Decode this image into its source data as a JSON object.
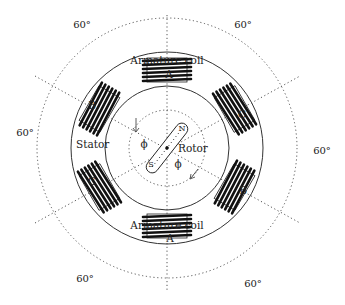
{
  "diagram": {
    "type": "three-phase generator schematic",
    "labels": {
      "armature_top": "Armature coil",
      "armature_bottom": "Armature coil",
      "stator": "Stator",
      "rotor": "Rotor",
      "phi_left": "ϕ",
      "phi_right": "ϕ",
      "rotor_n": "N",
      "rotor_s": "S"
    },
    "coils": [
      {
        "id": "top",
        "phase": "A",
        "angle_deg": 0
      },
      {
        "id": "upper-right",
        "phase": "C",
        "angle_deg": 60
      },
      {
        "id": "lower-right",
        "phase": "B",
        "angle_deg": 120
      },
      {
        "id": "bottom",
        "phase": "A",
        "angle_deg": 180
      },
      {
        "id": "lower-left",
        "phase": "C",
        "angle_deg": 240
      },
      {
        "id": "upper-left",
        "phase": "B",
        "angle_deg": 300
      }
    ],
    "sector_angles": [
      {
        "position": "top-left",
        "text": "60°"
      },
      {
        "position": "top-right",
        "text": "60°"
      },
      {
        "position": "left",
        "text": "60°"
      },
      {
        "position": "right",
        "text": "60°"
      },
      {
        "position": "bottom-left",
        "text": "60°"
      },
      {
        "position": "bottom-right",
        "text": "60°"
      }
    ],
    "colors": {
      "line": "#222222",
      "background": "#ffffff"
    }
  }
}
